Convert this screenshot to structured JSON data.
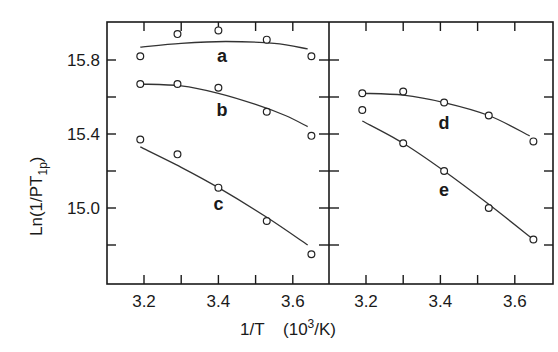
{
  "chart_data": {
    "type": "scatter",
    "title": "",
    "xlabel": "1/T",
    "xlabel_units": "(10³/K)",
    "xlabel_units_base": "10",
    "xlabel_units_sup": "3",
    "xlabel_units_tail": "/K)",
    "ylabel": "Ln(1/PT1p)",
    "ylabel_main": "Ln(1/PT",
    "ylabel_sub": "1p",
    "ylim": [
      14.7,
      16.0
    ],
    "xlim": [
      3.1,
      3.7
    ],
    "grid": false,
    "y_ticks": [
      {
        "value": 15.8,
        "label": "15.8"
      },
      {
        "value": 15.4,
        "label": "15.4"
      },
      {
        "value": 15.0,
        "label": "15.0"
      }
    ],
    "y_minor_ticks": [
      15.6,
      15.2,
      14.8
    ],
    "x_ticks": [
      {
        "value": 3.2,
        "label": "3.2"
      },
      {
        "value": 3.4,
        "label": "3.4"
      },
      {
        "value": 3.6,
        "label": "3.6"
      }
    ],
    "x_minor_ticks": [
      3.3,
      3.5
    ],
    "panels": [
      {
        "name": "left",
        "series": [
          {
            "name": "a",
            "x": [
              3.19,
              3.29,
              3.4,
              3.53,
              3.65
            ],
            "values": [
              15.82,
              15.94,
              15.96,
              15.91,
              15.82
            ],
            "fit": [
              [
                3.19,
                15.87
              ],
              [
                3.3,
                15.89
              ],
              [
                3.42,
                15.9
              ],
              [
                3.55,
                15.89
              ],
              [
                3.64,
                15.86
              ]
            ],
            "label_pos": [
              3.41,
              15.82
            ]
          },
          {
            "name": "b",
            "x": [
              3.19,
              3.29,
              3.4,
              3.53,
              3.65
            ],
            "values": [
              15.67,
              15.67,
              15.65,
              15.52,
              15.39
            ],
            "fit": [
              [
                3.19,
                15.67
              ],
              [
                3.3,
                15.66
              ],
              [
                3.4,
                15.62
              ],
              [
                3.5,
                15.56
              ],
              [
                3.58,
                15.5
              ],
              [
                3.64,
                15.44
              ]
            ],
            "label_pos": [
              3.41,
              15.53
            ]
          },
          {
            "name": "c",
            "x": [
              3.19,
              3.29,
              3.4,
              3.53,
              3.65
            ],
            "values": [
              15.37,
              15.29,
              15.11,
              14.93,
              14.75
            ],
            "fit": [
              [
                3.19,
                15.33
              ],
              [
                3.3,
                15.22
              ],
              [
                3.4,
                15.11
              ],
              [
                3.53,
                14.95
              ],
              [
                3.64,
                14.8
              ]
            ],
            "label_pos": [
              3.4,
              15.02
            ]
          }
        ]
      },
      {
        "name": "right",
        "series": [
          {
            "name": "d",
            "x": [
              3.19,
              3.3,
              3.41,
              3.53,
              3.65
            ],
            "values": [
              15.62,
              15.63,
              15.57,
              15.5,
              15.36
            ],
            "fit": [
              [
                3.19,
                15.62
              ],
              [
                3.3,
                15.61
              ],
              [
                3.41,
                15.57
              ],
              [
                3.53,
                15.5
              ],
              [
                3.64,
                15.39
              ]
            ],
            "label_pos": [
              3.41,
              15.46
            ]
          },
          {
            "name": "e",
            "x": [
              3.19,
              3.3,
              3.41,
              3.53,
              3.65
            ],
            "values": [
              15.53,
              15.35,
              15.2,
              15.0,
              14.83
            ],
            "fit": [
              [
                3.19,
                15.47
              ],
              [
                3.3,
                15.35
              ],
              [
                3.41,
                15.2
              ],
              [
                3.53,
                15.02
              ],
              [
                3.65,
                14.83
              ]
            ],
            "label_pos": [
              3.41,
              15.1
            ]
          }
        ]
      }
    ]
  }
}
